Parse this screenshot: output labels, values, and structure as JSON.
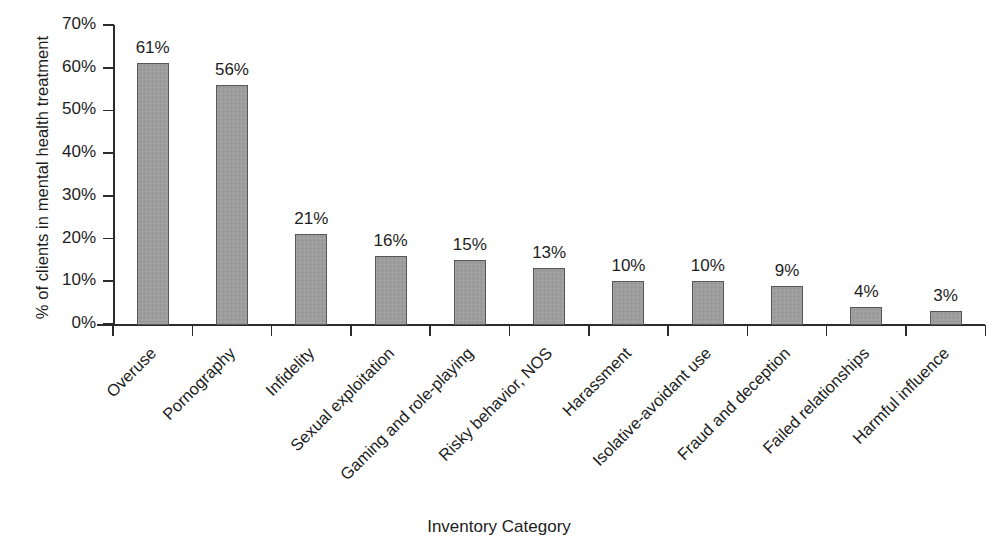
{
  "chart_data": {
    "type": "bar",
    "title": "",
    "xlabel": "Inventory Category",
    "ylabel": "% of clients in mental health treatment",
    "ylim": [
      0,
      70
    ],
    "grid": false,
    "legend": false,
    "y_tick_labels": [
      "70%",
      "60%",
      "50%",
      "40%",
      "30%",
      "20%",
      "10%",
      "0%"
    ],
    "y_ticks": [
      70,
      60,
      50,
      40,
      30,
      20,
      10,
      0
    ],
    "categories": [
      "Overuse",
      "Pornography",
      "Infidelity",
      "Sexual exploitation",
      "Gaming and role-playing",
      "Risky behavior, NOS",
      "Harassment",
      "Isolative-avoidant use",
      "Fraud and deception",
      "Failed relationships",
      "Harmful influence"
    ],
    "values": [
      61,
      56,
      21,
      16,
      15,
      13,
      10,
      10,
      9,
      4,
      3
    ],
    "value_labels": [
      "61%",
      "56%",
      "21%",
      "16%",
      "15%",
      "13%",
      "10%",
      "10%",
      "9%",
      "4%",
      "3%"
    ],
    "bar_color": "#9d9d9d",
    "bar_edge_color": "#55585a",
    "axis_color": "#2b2b2b",
    "background_color": "#ffffff"
  }
}
